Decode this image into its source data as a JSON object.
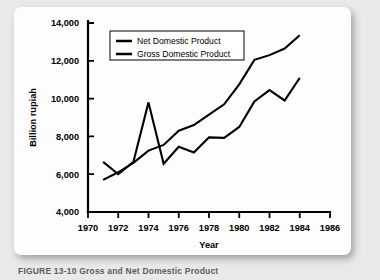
{
  "figure": {
    "caption": "FIGURE 13-10  Gross and Net Domestic Product"
  },
  "chart_data": {
    "type": "line",
    "title": "",
    "xlabel": "Year",
    "ylabel": "Billion rupiah",
    "xlim": [
      1970,
      1986
    ],
    "ylim": [
      4000,
      14000
    ],
    "xticks": [
      1970,
      1972,
      1974,
      1976,
      1978,
      1980,
      1982,
      1984,
      1986
    ],
    "xtick_labels": [
      "1970",
      "1972",
      "1974",
      "1976",
      "1978",
      "1980",
      "1982",
      "1984",
      "1986"
    ],
    "yticks": [
      4000,
      6000,
      8000,
      10000,
      12000,
      14000
    ],
    "ytick_labels": [
      "4,000",
      "6,000",
      "8,000",
      "10,000",
      "12,000",
      "14,000"
    ],
    "grid": false,
    "legend_position": "upper left",
    "line_color": "#000000",
    "series": [
      {
        "name": "Net Domestic Product",
        "x": [
          1971,
          1972,
          1973,
          1974,
          1975,
          1976,
          1977,
          1978,
          1979,
          1980,
          1981,
          1982,
          1983,
          1984
        ],
        "values": [
          6650,
          6000,
          6650,
          9800,
          6550,
          7450,
          7150,
          7950,
          7920,
          8500,
          9850,
          10450,
          9900,
          11100
        ]
      },
      {
        "name": "Gross Domestic Product",
        "x": [
          1971,
          1972,
          1973,
          1974,
          1975,
          1976,
          1977,
          1978,
          1979,
          1980,
          1981,
          1982,
          1983,
          1984
        ],
        "values": [
          5700,
          6100,
          6600,
          7250,
          7550,
          8300,
          8600,
          9150,
          9700,
          10750,
          12050,
          12300,
          12650,
          13350
        ]
      }
    ]
  }
}
